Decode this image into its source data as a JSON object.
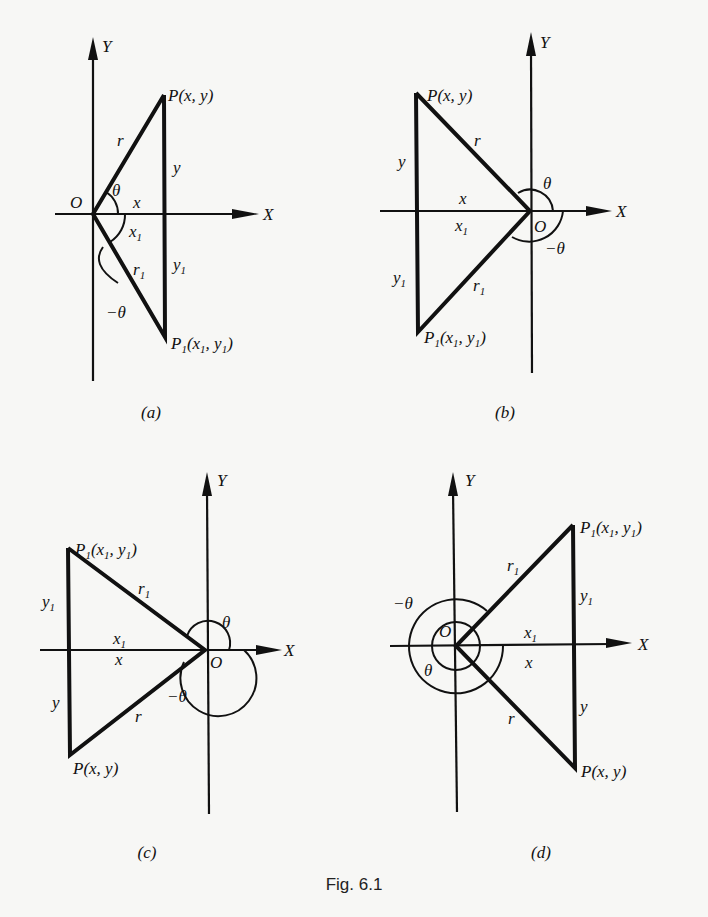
{
  "figure": {
    "caption": "Fig. 6.1",
    "panels": [
      {
        "id": "a",
        "caption": "(a)",
        "axis_x": "X",
        "axis_y": "Y",
        "origin": "O",
        "point": "P(x, y)",
        "point_reflected_main": "P",
        "point_reflected_sub": "1",
        "point_reflected_args": "(x",
        "point_reflected_args2": ", y",
        "point_reflected_close": ")",
        "r": "r",
        "r1": "r",
        "sub1": "1",
        "x": "x",
        "x1": "x",
        "y": "y",
        "y1": "y",
        "theta": "θ",
        "neg_theta": "−θ"
      },
      {
        "id": "b",
        "caption": "(b)",
        "axis_x": "X",
        "axis_y": "Y",
        "origin": "O",
        "point": "P(x, y)",
        "r": "r",
        "r1": "r",
        "sub1": "1",
        "x": "x",
        "x1": "x",
        "y": "y",
        "y1": "y",
        "theta": "θ",
        "neg_theta": "−θ"
      },
      {
        "id": "c",
        "caption": "(c)",
        "axis_x": "X",
        "axis_y": "Y",
        "origin": "O",
        "point": "P(x, y)",
        "r": "r",
        "r1": "r",
        "sub1": "1",
        "x": "x",
        "x1": "x",
        "y": "y",
        "y1": "y",
        "theta": "θ",
        "neg_theta": "−θ"
      },
      {
        "id": "d",
        "caption": "(d)",
        "axis_x": "X",
        "axis_y": "Y",
        "origin": "O",
        "point": "P(x, y)",
        "r": "r",
        "r1": "r",
        "sub1": "1",
        "x": "x",
        "x1": "x",
        "y": "y",
        "y1": "y",
        "theta": "θ",
        "neg_theta": "−θ"
      }
    ],
    "p1_label": {
      "P": "P",
      "one": "1",
      "open": "(x",
      "mid": ", y",
      "close": ")"
    }
  }
}
